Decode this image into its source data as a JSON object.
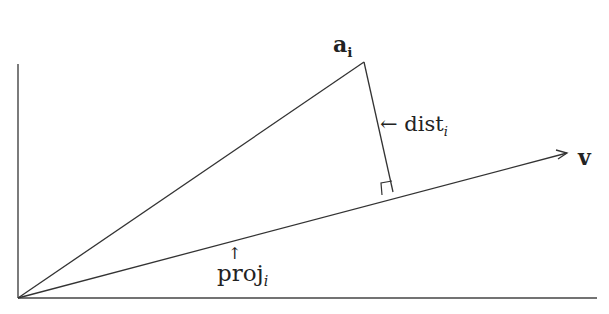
{
  "diagram": {
    "type": "vector-projection",
    "labels": {
      "point": {
        "base": "a",
        "sub": "i"
      },
      "vector": {
        "base": "v"
      },
      "distance": {
        "arrow": "←",
        "base": "dist",
        "sub": "i"
      },
      "projection": {
        "arrow": "↑",
        "base": "proj",
        "sub": "i"
      }
    },
    "geometry": {
      "origin": [
        18,
        298
      ],
      "y_axis_top": [
        18,
        64
      ],
      "x_axis_end": [
        597,
        298
      ],
      "point_a": [
        364,
        62
      ],
      "perp_foot": [
        393,
        192
      ],
      "vector_tip": [
        567,
        153
      ]
    },
    "colors": {
      "stroke": "#333333",
      "text": "#222222",
      "background": "#ffffff"
    }
  }
}
